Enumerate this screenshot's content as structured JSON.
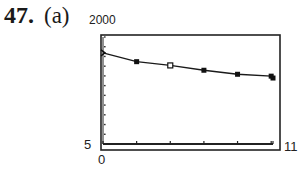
{
  "problem": {
    "number": "47.",
    "part": "(a)"
  },
  "window": {
    "ymax_label": "2000",
    "ymin_label": "5",
    "xmin_label": "0",
    "xmax_label": "11"
  },
  "chart_data": {
    "type": "line",
    "title": "",
    "xlabel": "",
    "ylabel": "",
    "xlim": [
      0,
      11
    ],
    "ylim": [
      5,
      2000
    ],
    "grid": false,
    "x": [
      0,
      2,
      4,
      6,
      8,
      10,
      11
    ],
    "series": [
      {
        "name": "model curve",
        "values": [
          1705,
          1540,
          1470,
          1380,
          1305,
          1270,
          1235
        ]
      }
    ],
    "markers": [
      {
        "x": 0,
        "y": 1705,
        "style": "tick"
      },
      {
        "x": 2,
        "y": 1540,
        "style": "filled-square"
      },
      {
        "x": 4,
        "y": 1470,
        "style": "open-square"
      },
      {
        "x": 6,
        "y": 1380,
        "style": "filled-square"
      },
      {
        "x": 8,
        "y": 1305,
        "style": "filled-square"
      },
      {
        "x": 10,
        "y": 1270,
        "style": "filled-square"
      },
      {
        "x": 11,
        "y": 1235,
        "style": "filled-square"
      }
    ],
    "x_ticks": [
      0,
      2,
      4,
      6,
      8,
      10,
      11
    ],
    "y_ticks_count": 11
  }
}
